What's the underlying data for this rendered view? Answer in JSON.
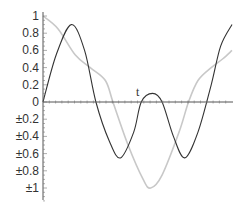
{
  "chart_data": {
    "type": "line",
    "title": "",
    "xlabel": "t",
    "ylabel": "",
    "ylim": [
      -1.2,
      1.0
    ],
    "xlim": [
      0,
      1
    ],
    "grid": false,
    "legend": null,
    "y_ticks": [
      {
        "value": 1,
        "label": "1"
      },
      {
        "value": 0.8,
        "label": "0.8"
      },
      {
        "value": 0.6,
        "label": "0.6"
      },
      {
        "value": 0.4,
        "label": "0.4"
      },
      {
        "value": 0.2,
        "label": "0.2"
      },
      {
        "value": 0,
        "label": "0"
      },
      {
        "value": -0.2,
        "label": "±0.2"
      },
      {
        "value": -0.4,
        "label": "±0.4"
      },
      {
        "value": -0.6,
        "label": "±0.6"
      },
      {
        "value": -0.8,
        "label": "±0.8"
      },
      {
        "value": -1,
        "label": "±1"
      }
    ],
    "series": [
      {
        "name": "dark-curve",
        "color": "#333333",
        "x": [
          0,
          0.07,
          0.15,
          0.22,
          0.28,
          0.35,
          0.41,
          0.48,
          0.52,
          0.58,
          0.63,
          0.69,
          0.75,
          0.82,
          0.89,
          0.94,
          1.0
        ],
        "y": [
          0,
          0.55,
          0.9,
          0.6,
          0,
          -0.45,
          -0.65,
          -0.35,
          0,
          0.1,
          0,
          -0.4,
          -0.65,
          -0.35,
          0.2,
          0.65,
          0.9
        ]
      },
      {
        "name": "light-curve",
        "color": "#c8c8c8",
        "x": [
          0,
          0.08,
          0.17,
          0.25,
          0.33,
          0.37,
          0.45,
          0.53,
          0.57,
          0.63,
          0.72,
          0.77,
          0.82,
          0.89,
          0.95,
          1.0
        ],
        "y": [
          1.0,
          0.85,
          0.55,
          0.4,
          0.25,
          0.0,
          -0.5,
          -0.9,
          -1.0,
          -0.85,
          -0.35,
          0.0,
          0.25,
          0.4,
          0.5,
          0.6
        ]
      }
    ]
  }
}
